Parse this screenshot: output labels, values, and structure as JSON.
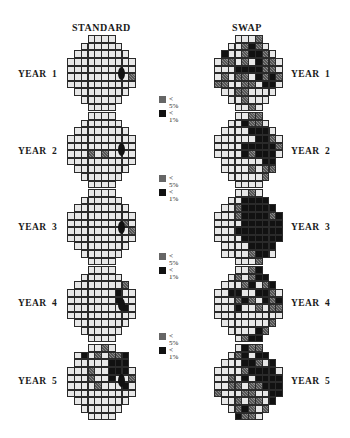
{
  "columns": {
    "left_title": "STANDARD",
    "right_title": "SWAP"
  },
  "legend": {
    "items": [
      {
        "swatch": "gray-hatched",
        "line1": "<",
        "line2": "5%"
      },
      {
        "swatch": "black",
        "line1": "<",
        "line2": "1%"
      }
    ],
    "colors": {
      "normal": "#e8e8e8",
      "p5": "#666666",
      "p1": "#111111"
    }
  },
  "years": [
    {
      "label": "YEAR  1"
    },
    {
      "label": "YEAR  2"
    },
    {
      "label": "YEAR  3"
    },
    {
      "label": "YEAR  4"
    },
    {
      "label": "YEAR  5"
    }
  ],
  "grids": {
    "standard": [
      [
        ".....",
        "....",
        "......",
        "........",
        "..........",
        "..........",
        ".........g",
        "..........",
        "........",
        "......",
        "...."
      ],
      [
        "",
        "....",
        "......",
        "........",
        "..........",
        "..........",
        "...g.g....",
        "..........",
        "........",
        "......",
        "...."
      ],
      [
        "",
        "....",
        "......",
        "........",
        "..........",
        "........g.",
        ".........g",
        "..........",
        "........",
        "......",
        "...."
      ],
      [
        "",
        "....",
        "......",
        ".......g",
        ".......b..",
        ".......b..",
        "........b.",
        "..........",
        "........",
        "......",
        "...."
      ],
      [
        "",
        "..g.",
        ".b.g.ggb",
        ".....bbb",
        "...g..bbb.",
        "...g..b..g",
        "....g...b.",
        "..........",
        "........",
        "......",
        "...."
      ]
    ],
    "swap": [
      [
        "",
        "...g",
        "..gbg.",
        "b..gbbg.",
        ".gg.g.bgg.",
        "...bbbbgg.",
        ".g.gg.bgbg",
        "gg..gg.bb.",
        "..gg....",
        "..g...",
        "..g."
      ],
      [
        "",
        "..gg",
        "..bgg.",
        "....bbb.",
        "......bbg.",
        "....bbbbbg",
        "....bgbbb.",
        "......bb",
        "....g.gg",
        ".....g",
        "...."
      ],
      [
        "",
        "..g.",
        "..bbbb",
        "..gbbbbb",
        "...gbbbbgb",
        "....bbbbbb",
        "...bbbbbbb",
        "....bbbbbb",
        "....bbbb",
        "....gbb.",
        "...g"
      ],
      [
        "",
        "..gb",
        ".g.gbb",
        "...gb.gb",
        "..bb..bbg.",
        "...gbg.bgb",
        "...b..g.gg",
        "..........",
        ".......g",
        "....bg",
        ".gbb"
      ],
      [
        "",
        ".bgg",
        ".gb.bb",
        "...bbg.b",
        "....gbbbb.",
        "..g.b.bbbb",
        "..gg.ggbbb",
        "g...gg..bb",
        "..g.gg.b",
        ".gbg.g",
        "bgg."
      ]
    ]
  }
}
